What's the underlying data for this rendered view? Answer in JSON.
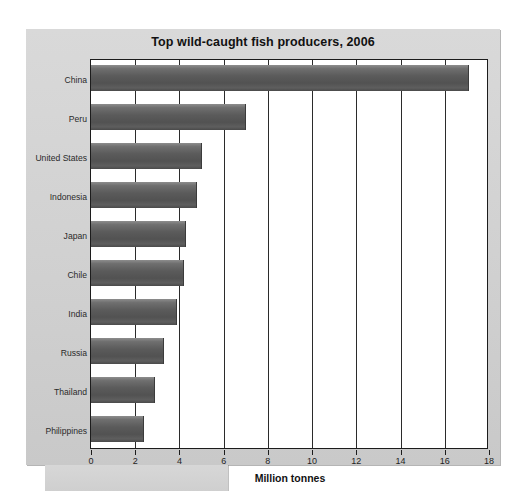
{
  "figure": {
    "title": "Top wild-caught fish producers, 2006"
  },
  "chart_data": {
    "type": "bar",
    "orientation": "horizontal",
    "title": "Top wild-caught fish producers, 2006",
    "xlabel": "Million tonnes",
    "ylabel": "",
    "xlim": [
      0,
      18
    ],
    "xticks": [
      0,
      2,
      4,
      6,
      8,
      10,
      12,
      14,
      16,
      18
    ],
    "grid": true,
    "grid_axis": "x",
    "legend": null,
    "bar_color": "#5b5b5b",
    "plot_background": "#ffffff",
    "panel_background": "#d4d4d4",
    "categories": [
      "China",
      "Peru",
      "United States",
      "Indonesia",
      "Japan",
      "Chile",
      "India",
      "Russia",
      "Thailand",
      "Philippines"
    ],
    "values": [
      17.1,
      7.0,
      5.0,
      4.8,
      4.3,
      4.2,
      3.9,
      3.3,
      2.9,
      2.4
    ],
    "units": "million tonnes"
  }
}
